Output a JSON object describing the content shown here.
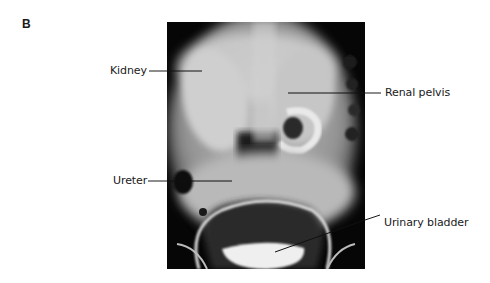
{
  "figure": {
    "panel_letter": "B",
    "image_description": "Intravenous pyelogram radiograph (anteroposterior abdomen/pelvis)",
    "labels": [
      {
        "id": "kidney",
        "text": "Kidney",
        "side": "left"
      },
      {
        "id": "renal-pelvis",
        "text": "Renal pelvis",
        "side": "right"
      },
      {
        "id": "ureter",
        "text": "Ureter",
        "side": "left"
      },
      {
        "id": "urinary-bladder",
        "text": "Urinary bladder",
        "side": "right"
      }
    ],
    "colors": {
      "background": "#ffffff",
      "xray_dark": "#050505",
      "xray_light": "#d8d8d8",
      "leader_line": "#1a1a1a",
      "text": "#1a1a1a"
    }
  }
}
